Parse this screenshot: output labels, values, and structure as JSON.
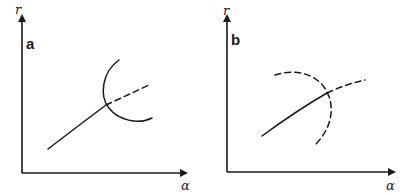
{
  "panels": [
    {
      "id": "a",
      "label": "a",
      "y_axis_label": "r",
      "x_axis_label": "α",
      "description": "Solid rising curve continues as dashed line past intersection with a solid circular arc (concave right)"
    },
    {
      "id": "b",
      "label": "b",
      "y_axis_label": "r",
      "x_axis_label": "α",
      "description": "Solid rising curve continues as dashed line past intersection with a dashed circular arc (concave left)"
    }
  ],
  "colors": {
    "ink": "#1a1a1a",
    "background": "#ffffff"
  }
}
